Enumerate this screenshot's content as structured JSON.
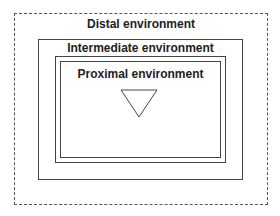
{
  "diagram": {
    "type": "nested-boxes",
    "levels": [
      {
        "label": "Distal environment",
        "border": "dashed"
      },
      {
        "label": "Intermediate environment",
        "border": "solid"
      },
      {
        "label": "Proximal environment",
        "border": "double"
      }
    ],
    "center_symbol": "inverted-triangle-icon",
    "colors": {
      "line": "#444444",
      "background": "#ffffff",
      "text": "#222222"
    }
  }
}
